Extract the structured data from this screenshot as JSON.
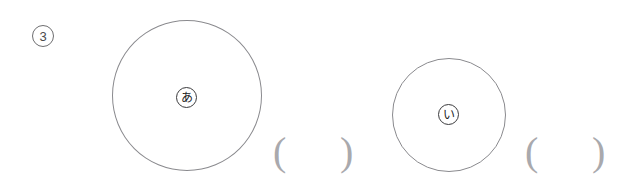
{
  "page": {
    "background_color": "#ffffff",
    "width": 640,
    "height": 188
  },
  "item": {
    "number_label": "3",
    "number_marker_style": "circled"
  },
  "figures": [
    {
      "name": "large-circle",
      "shape": "circle",
      "label": "あ",
      "label_style": "circled",
      "stroke_color": "#8a8a8e",
      "diameter_px": 150
    },
    {
      "name": "small-circle",
      "shape": "circle",
      "label": "い",
      "label_style": "circled",
      "stroke_color": "#8a8a8e",
      "diameter_px": 114
    }
  ],
  "answers": [
    {
      "name": "answer-blank-1",
      "open": "(",
      "close": ")",
      "value": "",
      "placeholder": ""
    },
    {
      "name": "answer-blank-2",
      "open": "(",
      "close": ")",
      "value": "",
      "placeholder": ""
    }
  ],
  "colors": {
    "figure_stroke": "#8a8a8e",
    "label_stroke": "#3a3a3c",
    "paren_color": "#a9a9ad",
    "number_color": "#4a4a4c"
  }
}
